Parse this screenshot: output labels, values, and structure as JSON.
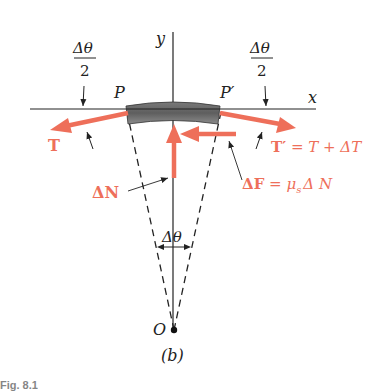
{
  "figure": {
    "subfigure_label": "(b)",
    "caption_fragment": "Fig. 8.1"
  },
  "axes": {
    "x_label": "x",
    "y_label": "y"
  },
  "points": {
    "P": "P",
    "P_prime": "P′",
    "O": "O"
  },
  "angles": {
    "left_half_angle": {
      "numerator": "Δθ",
      "denominator": "2"
    },
    "right_half_angle": {
      "numerator": "Δθ",
      "denominator": "2"
    },
    "center_angle": "Δθ"
  },
  "forces": {
    "T": {
      "label": "T"
    },
    "T_prime": {
      "label_bold": "T′",
      "label_rest": "= T + ΔT"
    },
    "delta_N": {
      "label": "ΔN"
    },
    "delta_F": {
      "label_bold": "ΔF",
      "label_rest": "= μ",
      "subscript": "s",
      "label_tail": "Δ N"
    }
  },
  "colors": {
    "force_arrow": "#EE6F5A",
    "band_dark": "#5e5e5e",
    "band_light": "#9a9a9a",
    "line": "#222222"
  }
}
